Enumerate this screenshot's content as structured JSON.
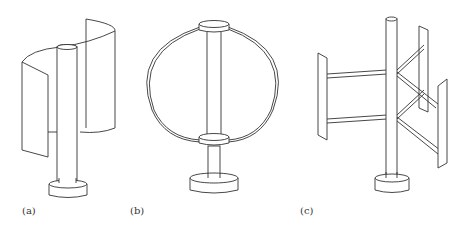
{
  "figure": {
    "panels": [
      {
        "id": "a",
        "label": "(a)",
        "type": "Savonius rotor"
      },
      {
        "id": "b",
        "label": "(b)",
        "type": "Darrieus rotor (eggbeater)"
      },
      {
        "id": "c",
        "label": "(c)",
        "type": "H-rotor (Giromill)"
      }
    ],
    "line_color": "#333333",
    "background": "#ffffff"
  }
}
